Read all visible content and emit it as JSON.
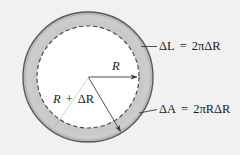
{
  "figure": {
    "background_color": "#f1f1f1",
    "ring_fill_color": "#c9c9c9",
    "inner_fill_color": "#ffffff",
    "stroke_color": "#555555",
    "text_color": "#1b1b1b"
  },
  "geometry": {
    "center_x": 88,
    "center_y": 77,
    "outer_radius": 65,
    "inner_radius": 51,
    "inner_boundary_style": "dashed",
    "outer_boundary_style": "solid"
  },
  "labels": {
    "delta_l": {
      "lhs_symbol": "ΔL",
      "equals": "=",
      "rhs": "2πΔR",
      "rhs_coefficient": "2",
      "rhs_pi": "π",
      "rhs_delta_r": "ΔR",
      "full_text": "ΔL = 2πΔR"
    },
    "delta_a": {
      "lhs_symbol": "ΔA",
      "equals": "=",
      "rhs": "2πRΔR",
      "rhs_coefficient": "2",
      "rhs_pi": "π",
      "rhs_r": "R",
      "rhs_delta_r": "ΔR",
      "full_text": "ΔA = 2πRΔR"
    },
    "inner_radius_label": {
      "text": "R"
    },
    "outer_radius_label": {
      "lead": "R",
      "plus": "+",
      "delta_r": "ΔR",
      "full_text": "R + ΔR"
    }
  },
  "annotations": {
    "inner_radius_arrow": {
      "from": "center",
      "to": "inner-dashed-circle",
      "direction": "horizontal-right",
      "has_arrowhead": true
    },
    "outer_radius_line": {
      "from": "center",
      "to": "outer-circle",
      "direction": "down-right",
      "has_arrowhead": true
    },
    "delta_l_leader": {
      "from": "outer-ring-upper-right",
      "to": "delta-l-label",
      "style": "solid-line"
    },
    "delta_a_leader": {
      "from": "outer-ring-lower-right",
      "to": "delta-a-label",
      "style": "solid-line"
    }
  }
}
